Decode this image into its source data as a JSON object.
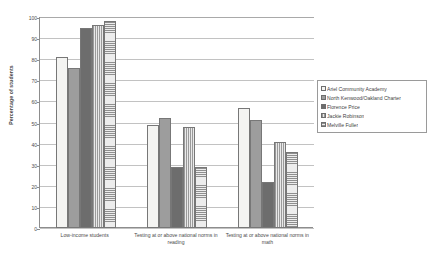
{
  "chart_data": {
    "type": "bar",
    "title": "",
    "xlabel": "",
    "ylabel": "Percentage of students",
    "ylim": [
      0,
      100
    ],
    "ytick_labels": [
      "100",
      "90",
      "80",
      "70",
      "60",
      "50",
      "40",
      "30",
      "20",
      "10",
      "0"
    ],
    "ytick_values": [
      100,
      90,
      80,
      70,
      60,
      50,
      40,
      30,
      20,
      10,
      0
    ],
    "grid": true,
    "legend_position": "right",
    "categories": [
      "Low-income students",
      "Testing at or above national norms in reading",
      "Testing at or above national norms in math"
    ],
    "series": [
      {
        "name": "Ariel Community Academy",
        "values": [
          81,
          49,
          57
        ],
        "fill": "solid-light",
        "color": "#f4f4f2"
      },
      {
        "name": "North Kenwood/Oakland Charter",
        "values": [
          76,
          52,
          51
        ],
        "fill": "dotted-gray",
        "color": "#9d9d9d"
      },
      {
        "name": "Florence Price",
        "values": [
          95,
          29,
          22
        ],
        "fill": "solid-dark",
        "color": "#6d6d6d"
      },
      {
        "name": "Jackie Robinson",
        "values": [
          96,
          48,
          41
        ],
        "fill": "vertical-lines",
        "color": "#d8d8d8"
      },
      {
        "name": "Melville Fuller",
        "values": [
          98,
          29,
          36
        ],
        "fill": "horizontal-lines",
        "color": "#d2d2d2"
      }
    ]
  }
}
